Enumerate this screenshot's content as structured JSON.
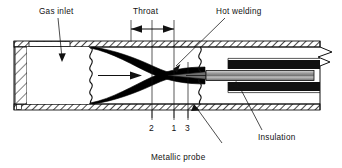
{
  "figure": {
    "title_labels": {
      "gas_inlet": "Gas inlet",
      "throat": "Throat",
      "hot_welding": "Hot welding",
      "insulation": "Insulation",
      "metallic_probe": "Metallic probe"
    },
    "station_numbers": [
      "2",
      "1",
      "3"
    ],
    "colors": {
      "line": "#111111",
      "fill_white": "#ffffff",
      "nozzle_black": "#000000",
      "insulation_black": "#101010",
      "probe_gray": "#9a9a9a",
      "hatch": "#1a1a1a",
      "background": "#ffffff"
    },
    "icons": {
      "flow_arrow": "flow-arrow-right",
      "dimension_arrow": "double-headed-dimension-arrow",
      "break_line": "zigzag-break-line",
      "wavy_line": "wavy-break-line"
    }
  }
}
